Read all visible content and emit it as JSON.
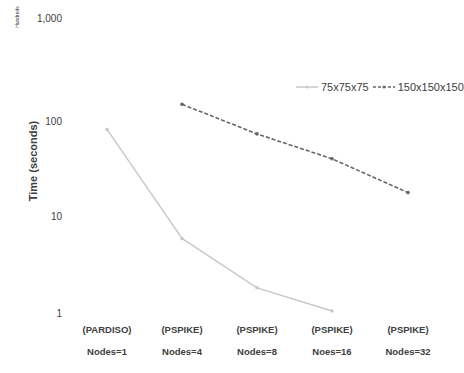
{
  "chart_data": {
    "type": "line",
    "title": "",
    "xlabel": "",
    "ylabel": "Time (seconds)",
    "y_units_label": "Hundreds",
    "yscale": "log",
    "ylim": [
      1,
      1000
    ],
    "yticks": [
      "1,000",
      "100",
      "10",
      "1"
    ],
    "grid": false,
    "legend_position": "top-right",
    "categories": [
      {
        "solver": "(PARDISO)",
        "nodes": "Nodes=1"
      },
      {
        "solver": "(PSPIKE)",
        "nodes": "Nodes=4"
      },
      {
        "solver": "(PSPIKE)",
        "nodes": "Nodes=8"
      },
      {
        "solver": "(PSPIKE)",
        "nodes": "Noes=16"
      },
      {
        "solver": "(PSPIKE)",
        "nodes": "Nodes=32"
      }
    ],
    "series": [
      {
        "name": "75x75x75",
        "style": "solid",
        "color": "#c8c8c8",
        "values": [
          80,
          6.1,
          1.9,
          1.1,
          null
        ]
      },
      {
        "name": "150x150x150",
        "style": "dashed",
        "color": "#666666",
        "values": [
          null,
          145,
          72,
          40,
          18
        ]
      }
    ]
  },
  "legend": {
    "items": [
      {
        "label": "75x75x75"
      },
      {
        "label": "150x150x150"
      }
    ]
  }
}
